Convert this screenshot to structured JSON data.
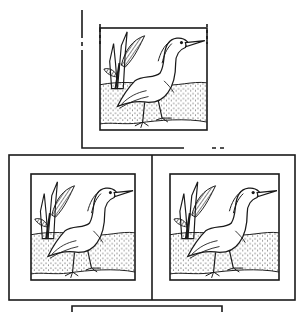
{
  "figure": {
    "colors": {
      "ink": "#1a1a1a",
      "paper": "#ffffff"
    },
    "panels": [
      {
        "id": "top",
        "subject": "egret-facing-right"
      },
      {
        "id": "bottom-left",
        "subject": "egret-facing-right"
      },
      {
        "id": "bottom-right",
        "subject": "egret-facing-right"
      }
    ]
  }
}
